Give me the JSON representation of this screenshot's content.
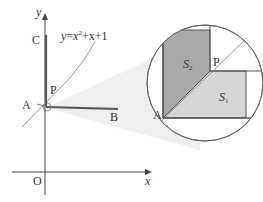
{
  "figure": {
    "curve_label": {
      "y": "y",
      "eq": "=",
      "x": "x",
      "exp": "2",
      "rest": "+x+1"
    },
    "axes": {
      "x_label": "x",
      "y_label": "y",
      "origin_label": "O"
    },
    "points": {
      "A": "A",
      "B": "B",
      "C": "C",
      "P": "P"
    },
    "inset": {
      "region_dark": {
        "label": "S",
        "sub": "2",
        "color": "#a9a9a9"
      },
      "region_light": {
        "label": "S",
        "sub": "1",
        "color": "#d6d6d6"
      },
      "point_A": "A",
      "point_P": "P"
    },
    "colors": {
      "line": "#555555",
      "axis": "#444444",
      "cone": "#ebebeb"
    }
  }
}
